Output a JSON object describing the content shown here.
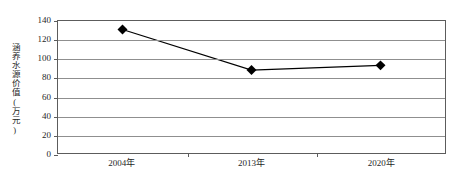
{
  "chart_data": {
    "type": "line",
    "title": "",
    "subtitle": "",
    "xlabel": "",
    "ylabel": "涵养水源价值(万元)",
    "categories": [
      "2004年",
      "2013年",
      "2020年"
    ],
    "values": [
      131,
      88,
      93
    ],
    "series": [
      {
        "name": "涵养水源价值",
        "values": [
          131,
          88,
          93
        ],
        "marker": "diamond",
        "marker_color": "#000000",
        "line_color": "#000000"
      }
    ],
    "ylim": [
      0,
      140
    ],
    "y_ticks": [
      0,
      20,
      40,
      60,
      80,
      100,
      120,
      140
    ],
    "y_tick_labels": [
      "0",
      "20",
      "40",
      "60",
      "80",
      "100",
      "120",
      "140"
    ],
    "x_tick_labels": [
      "2004年",
      "2013年",
      "2020年"
    ],
    "grid": true,
    "grid_axis": "y",
    "legend": false,
    "legend_position": "none",
    "annotations": [],
    "colors": {
      "line": "#000000",
      "marker": "#000000",
      "grid": "#8f8f8f",
      "frame": "#5c5c5c",
      "text": "#1f1f1f",
      "background": "#ffffff"
    }
  }
}
